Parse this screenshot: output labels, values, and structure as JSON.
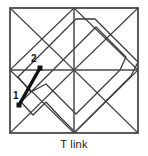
{
  "figure": {
    "caption": "T link",
    "background_color": "#ffffff",
    "line_color": "#3a3a3a",
    "frame_color": "#4a4a4a",
    "link_color": "#111111",
    "width": 148,
    "height": 156
  },
  "frame": {
    "name": "outer-square",
    "x": 10,
    "y": 8,
    "width": 128,
    "height": 125
  },
  "grid": {
    "horizontal_midline": {
      "x1": 10,
      "y1": 70,
      "x2": 138,
      "y2": 70
    },
    "vertical_midline": {
      "x1": 74,
      "y1": 8,
      "x2": 74,
      "y2": 133
    }
  },
  "diagonals": [
    {
      "name": "tl-cell-diag-a",
      "x1": 10,
      "y1": 8,
      "x2": 74,
      "y2": 70
    },
    {
      "name": "tl-cell-diag-b",
      "x1": 74,
      "y1": 8,
      "x2": 10,
      "y2": 70
    },
    {
      "name": "tr-cell-diag-a",
      "x1": 74,
      "y1": 8,
      "x2": 138,
      "y2": 70
    },
    {
      "name": "tr-cell-diag-b",
      "x1": 138,
      "y1": 8,
      "x2": 74,
      "y2": 70
    },
    {
      "name": "bl-cell-diag-a",
      "x1": 10,
      "y1": 70,
      "x2": 74,
      "y2": 133
    },
    {
      "name": "bl-cell-diag-b",
      "x1": 74,
      "y1": 70,
      "x2": 10,
      "y2": 133
    },
    {
      "name": "br-cell-diag-a",
      "x1": 74,
      "y1": 70,
      "x2": 138,
      "y2": 133
    },
    {
      "name": "br-cell-diag-b",
      "x1": 138,
      "y1": 70,
      "x2": 74,
      "y2": 133
    }
  ],
  "knot": {
    "name": "knot-polygon",
    "points": "31,92 18,77 47,48 76,19 95,19 125,49 138,62 131,76 118,89 105,102 90,117 75,132 60,117 46,102 33,115 21,102 36,87 51,72 66,57 81,42 96,27 111,42 126,57 120,70 106,84 91,99 76,114 61,99 46,84 31,92"
  },
  "link": {
    "name": "t-link-segment",
    "start": {
      "x": 19,
      "y": 105,
      "label": "1",
      "label_x": 13,
      "label_y": 96
    },
    "end": {
      "x": 40,
      "y": 68,
      "label": "2",
      "label_x": 32,
      "label_y": 62
    },
    "stroke_width": 3.4,
    "dot_size": 5
  }
}
